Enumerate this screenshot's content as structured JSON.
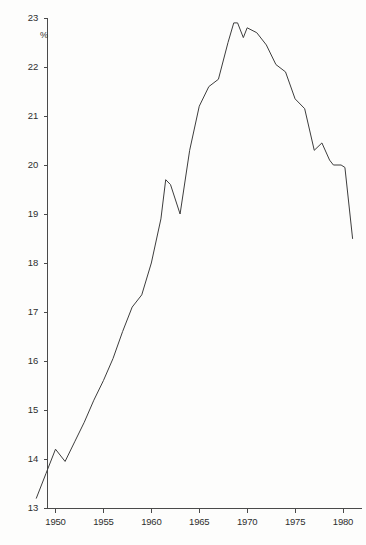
{
  "chart_data": {
    "type": "line",
    "title": "",
    "subtitle": "",
    "xlabel": "",
    "ylabel": "%",
    "unit_label": "%",
    "xlim": [
      1948,
      1981.5
    ],
    "ylim": [
      13,
      23
    ],
    "grid": false,
    "legend": null,
    "y_ticks": [
      23,
      22,
      21,
      20,
      19,
      18,
      17,
      16,
      15,
      14,
      13
    ],
    "y_tick_labels": [
      "23",
      "22",
      "21",
      "20",
      "19",
      "18",
      "17",
      "16",
      "15",
      "14",
      "13"
    ],
    "x_ticks": [
      1950,
      1955,
      1960,
      1965,
      1970,
      1975,
      1980
    ],
    "x_tick_labels": [
      "1950",
      "1955",
      "1960",
      "1965",
      "1970",
      "1975",
      "1980"
    ],
    "series": [
      {
        "name": "share",
        "x": [
          1948,
          1949,
          1950,
          1951,
          1952,
          1953,
          1954,
          1955,
          1956,
          1957,
          1958,
          1959,
          1960,
          1961,
          1961.5,
          1962,
          1963,
          1964,
          1965,
          1966,
          1967,
          1968,
          1968.6,
          1969,
          1969.6,
          1970,
          1971,
          1972,
          1973,
          1974,
          1975,
          1976,
          1977,
          1977.8,
          1978.6,
          1979,
          1979.8,
          1980.2,
          1981
        ],
        "y": [
          13.2,
          13.7,
          14.2,
          13.95,
          14.35,
          14.75,
          15.2,
          15.6,
          16.05,
          16.6,
          17.1,
          17.35,
          18.0,
          18.9,
          19.7,
          19.6,
          19.0,
          20.3,
          21.2,
          21.6,
          21.75,
          22.5,
          22.9,
          22.9,
          22.6,
          22.8,
          22.7,
          22.45,
          22.05,
          21.9,
          21.35,
          21.15,
          20.3,
          20.45,
          20.1,
          20.0,
          20.0,
          19.95,
          18.5
        ]
      }
    ],
    "annotations": []
  },
  "axes": {
    "y_axis_name": "vertical-percent-axis",
    "x_axis_name": "horizontal-year-axis"
  }
}
